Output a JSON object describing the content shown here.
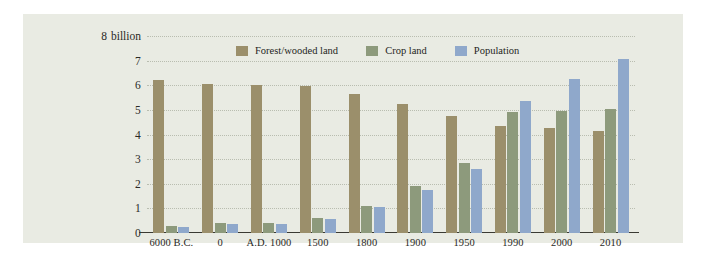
{
  "chart_data": {
    "type": "bar",
    "title": "",
    "subtitle": "",
    "xlabel": "",
    "ylabel": "",
    "unit_label": "billion",
    "unit_label_value": "8",
    "categories": [
      "6000 B.C.",
      "0",
      "A.D. 1000",
      "1500",
      "1800",
      "1900",
      "1950",
      "1990",
      "2000",
      "2010"
    ],
    "series": [
      {
        "name": "Forest/wooded land",
        "color": "#9b8f6b",
        "values": [
          6.2,
          6.05,
          6.0,
          5.95,
          5.65,
          5.25,
          4.75,
          4.35,
          4.25,
          4.15
        ]
      },
      {
        "name": "Crop land",
        "color": "#8d9a7c",
        "values": [
          0.3,
          0.4,
          0.4,
          0.6,
          1.1,
          1.9,
          2.85,
          4.9,
          4.95,
          5.05
        ]
      },
      {
        "name": "Population",
        "color": "#8fa8cb",
        "values": [
          0.25,
          0.35,
          0.35,
          0.55,
          1.05,
          1.75,
          2.6,
          5.35,
          6.25,
          7.05
        ]
      }
    ],
    "ylim": [
      0,
      8
    ],
    "yticks": [
      0,
      1,
      2,
      3,
      4,
      5,
      6,
      7,
      8
    ],
    "ytick_labels": [
      "0",
      "1",
      "2",
      "3",
      "4",
      "5",
      "6",
      "7",
      "8"
    ],
    "grid": true,
    "grid_style": "dotted-horizontal",
    "legend_position": "top-center"
  },
  "colors": {
    "panel_background": "#e9ebe3",
    "page_background": "#ffffff",
    "axis": "#3a3a33",
    "gridline": "#b9bdb0",
    "text": "#2a2a26"
  }
}
